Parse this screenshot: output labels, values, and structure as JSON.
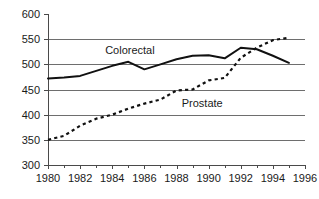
{
  "chart_data": {
    "type": "line",
    "title": "",
    "subtitle": "",
    "xlabel": "",
    "ylabel": "",
    "xlim": [
      1980,
      1996
    ],
    "ylim": [
      300,
      600
    ],
    "grid": true,
    "grid_axis": "y",
    "legend_position": "inline-annotation",
    "x": [
      1980,
      1981,
      1982,
      1983,
      1984,
      1985,
      1986,
      1987,
      1988,
      1989,
      1990,
      1991,
      1992,
      1993,
      1994,
      1995
    ],
    "y_ticks": [
      300,
      350,
      400,
      450,
      500,
      550,
      600
    ],
    "y_tick_labels": [
      "300",
      "350",
      "400",
      "450",
      "500",
      "550",
      "600"
    ],
    "x_ticks": [
      1980,
      1982,
      1984,
      1986,
      1988,
      1990,
      1992,
      1994,
      1996
    ],
    "x_tick_labels": [
      "1980",
      "1982",
      "1984",
      "1986",
      "1988",
      "1990",
      "1992",
      "1994",
      "1996"
    ],
    "x_minor_ticks": [
      1981,
      1983,
      1985,
      1987,
      1989,
      1991,
      1993,
      1995
    ],
    "series": [
      {
        "name": "Colorectal",
        "style": "solid",
        "color": "#111111",
        "values": [
          472,
          474,
          477,
          487,
          497,
          505,
          490,
          500,
          510,
          517,
          518,
          512,
          533,
          530,
          517,
          503
        ],
        "annotation": {
          "text": "Colorectal",
          "x": 1985.1,
          "y": 528
        }
      },
      {
        "name": "Prostate",
        "style": "dotted",
        "color": "#111111",
        "values": [
          350,
          358,
          378,
          392,
          400,
          412,
          422,
          430,
          448,
          450,
          468,
          473,
          513,
          533,
          548,
          553
        ],
        "annotation": {
          "text": "Prostate",
          "x": 1989.6,
          "y": 424
        }
      }
    ]
  }
}
